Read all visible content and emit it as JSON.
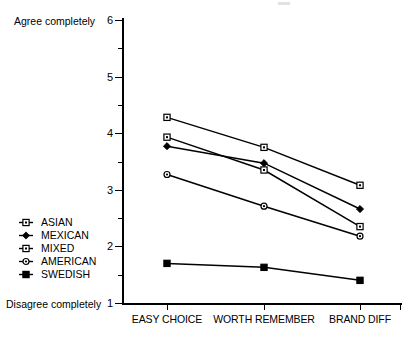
{
  "chart_data": {
    "type": "line",
    "title": "",
    "xlabel": "",
    "ylabel": "",
    "categories": [
      "EASY CHOICE",
      "WORTH REMEMBER",
      "BRAND DIFF"
    ],
    "ylim": [
      1,
      6
    ],
    "yticks": [
      1,
      2,
      3,
      4,
      5,
      6
    ],
    "ytick_labels": [
      "1",
      "2",
      "3",
      "4",
      "5",
      "6"
    ],
    "yminor_ticks": [
      1.5,
      2.5,
      3.5,
      4.5,
      5.5
    ],
    "y_axis_top_anchor": "Agree completely",
    "y_axis_bottom_anchor": "Disagree completely",
    "grid": false,
    "legend_position": "left-middle",
    "series": [
      {
        "name": "ASIAN",
        "marker": "open-square",
        "values": [
          4.28,
          3.75,
          3.08
        ]
      },
      {
        "name": "MEXICAN",
        "marker": "filled-diamond",
        "values": [
          3.77,
          3.47,
          2.66
        ]
      },
      {
        "name": "MIXED",
        "marker": "open-square",
        "values": [
          3.93,
          3.35,
          2.35
        ]
      },
      {
        "name": "AMERICAN",
        "marker": "open-circle",
        "values": [
          3.27,
          2.71,
          2.18
        ]
      },
      {
        "name": "SWEDISH",
        "marker": "filled-square",
        "values": [
          1.7,
          1.63,
          1.4
        ]
      }
    ],
    "line_color": "#000000",
    "background_color": "#ffffff"
  },
  "legend": {
    "items": [
      {
        "label": "ASIAN"
      },
      {
        "label": "MEXICAN"
      },
      {
        "label": "MIXED"
      },
      {
        "label": "AMERICAN"
      },
      {
        "label": "SWEDISH"
      }
    ]
  }
}
